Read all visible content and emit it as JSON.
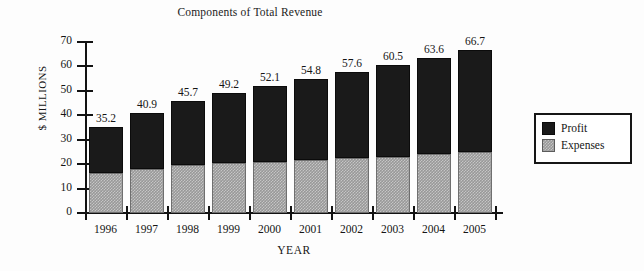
{
  "chart_data": {
    "type": "bar",
    "subtype": "stacked-vertical",
    "title": "Components of Total Revenue",
    "xlabel": "YEAR",
    "ylabel": "$ MILLIONS",
    "categories": [
      "1996",
      "1997",
      "1998",
      "1999",
      "2000",
      "2001",
      "2002",
      "2003",
      "2004",
      "2005"
    ],
    "series": [
      {
        "name": "Expenses",
        "color": "#989898",
        "values": [
          16.5,
          18.0,
          19.8,
          20.4,
          20.9,
          21.6,
          22.4,
          23.1,
          24.1,
          25.0
        ]
      },
      {
        "name": "Profit",
        "color": "#1a1a1a",
        "values": [
          18.7,
          22.9,
          25.9,
          28.8,
          31.2,
          33.2,
          35.2,
          37.4,
          39.5,
          41.7
        ]
      }
    ],
    "totals": [
      35.2,
      40.9,
      45.7,
      49.2,
      52.1,
      54.8,
      57.6,
      60.5,
      63.6,
      66.7
    ],
    "total_labels": [
      "35.2",
      "40.9",
      "45.7",
      "49.2",
      "52.1",
      "54.8",
      "57.6",
      "60.5",
      "63.6",
      "66.7"
    ],
    "ylim": [
      0,
      70
    ],
    "ytick_values": [
      0,
      10,
      20,
      30,
      40,
      50,
      60,
      70
    ],
    "ytick_labels": [
      "0",
      "10",
      "20",
      "30",
      "40",
      "50",
      "60",
      "70"
    ],
    "grid": false,
    "legend_position": "right",
    "legend_entries": [
      {
        "label": "Profit",
        "swatch": "profit"
      },
      {
        "label": "Expenses",
        "swatch": "expenses"
      }
    ]
  }
}
